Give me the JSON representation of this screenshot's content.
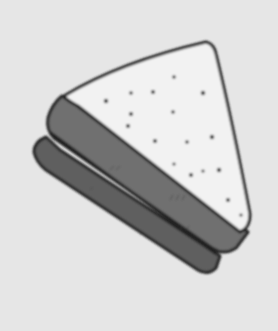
{
  "image": {
    "subject": "Hand-drawn sketch of a triangular sandwich",
    "style": "grayscale pencil/marker drawing",
    "colors": {
      "background": "#e6e6e6",
      "bread_top": "#f2f2f2",
      "crust": "#6e6e6e",
      "crust_dark": "#5a5a5a",
      "outline": "#222222",
      "seeds": "#333333"
    }
  }
}
